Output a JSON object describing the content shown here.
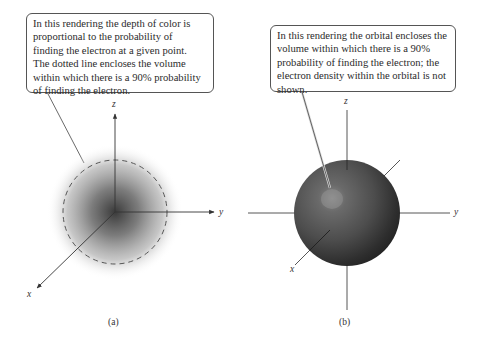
{
  "figure": {
    "panel_a": {
      "callout_text": "In this rendering the depth of color is\nproportional to the probability of\nfinding the electron at a given point.\nThe dotted line encloses the volume\nwithin which there is a 90% probability\nof finding the electron.",
      "axes": {
        "z": "z",
        "y": "y",
        "x": "x"
      },
      "label": "(a)",
      "cloud_color": "#3a3a3a",
      "boundary_style": "dashed"
    },
    "panel_b": {
      "callout_text": "In this rendering the orbital encloses the\nvolume within which there is a 90%\nprobability of finding the electron; the\nelectron density within the orbital is not\nshown.",
      "axes": {
        "z": "z",
        "y": "y",
        "x": "x"
      },
      "label": "(b)",
      "sphere_color": "#4a4a4a",
      "highlight_color": "#8a8a8a"
    }
  }
}
